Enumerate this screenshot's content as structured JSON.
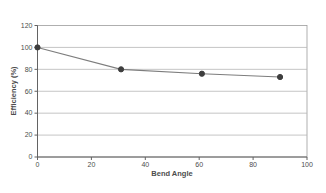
{
  "figure": {
    "background": "#ffffff"
  },
  "chart_data": {
    "type": "line",
    "title": "",
    "xlabel": "Bend Angle",
    "ylabel": "Efficiency (%)",
    "x": [
      0,
      31,
      61,
      90
    ],
    "y": [
      100,
      80,
      76,
      73
    ],
    "xlim": [
      0,
      100
    ],
    "ylim": [
      0,
      120
    ],
    "xticks": [
      0,
      20,
      40,
      60,
      80,
      100
    ],
    "yticks": [
      0,
      20,
      40,
      60,
      80,
      100,
      120
    ],
    "grid": "horizontal-only",
    "legend": "none",
    "marker": "filled-circle",
    "colors": {
      "line": "#7d7d7d",
      "marker": "#3e3e3e",
      "grid": "#b6b6b6",
      "axis": "#636363",
      "plot_border": "#9c9c9c",
      "text": "#4d4d4d",
      "background": "#ffffff"
    }
  }
}
